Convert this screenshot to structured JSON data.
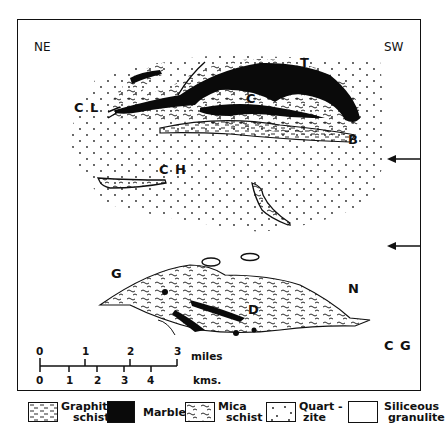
{
  "orientation": {
    "left": "NE",
    "right": "SW"
  },
  "map_labels": {
    "cl": "C L",
    "t": "T",
    "c": "C",
    "b": "B",
    "ch": "C H",
    "g": "G",
    "n": "N",
    "d": "D",
    "cg": "C G"
  },
  "scale_bar": {
    "miles_ticks": [
      "0",
      "1",
      "2",
      "3"
    ],
    "miles_unit": "miles",
    "km_ticks": [
      "0",
      "1",
      "2",
      "3",
      "4"
    ],
    "km_unit": "kms."
  },
  "arrows": [
    {
      "name": "upper-arrow",
      "direction": "left"
    },
    {
      "name": "lower-arrow",
      "direction": "left"
    }
  ],
  "legend": [
    {
      "line1": "Graphite",
      "line2": "schist",
      "pattern": "graphite-schist"
    },
    {
      "line1": "Marble",
      "line2": "",
      "pattern": "marble"
    },
    {
      "line1": "Mica",
      "line2": "schist",
      "pattern": "mica-schist"
    },
    {
      "line1": "Quart -",
      "line2": "zite",
      "pattern": "quartzite"
    },
    {
      "line1": "Siliceous",
      "line2": "granulite",
      "pattern": "siliceous-granulite"
    }
  ]
}
